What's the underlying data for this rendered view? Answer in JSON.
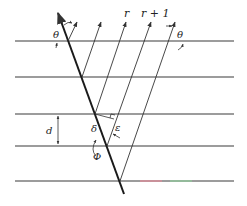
{
  "diagram": {
    "type": "geometry",
    "labels": {
      "theta_left": "θ",
      "theta_right": "θ",
      "r": "r",
      "r_plus_1": "r + 1",
      "d": "d",
      "delta": "δ",
      "epsilon": "ε",
      "phi": "Φ"
    },
    "planes": {
      "count": 5,
      "y_positions": [
        41,
        77,
        114,
        146,
        181
      ],
      "x_start": 15,
      "x_end": 234
    },
    "tilted_line": {
      "start": [
        58,
        13
      ],
      "end": [
        124,
        194
      ]
    },
    "rays": [
      {
        "from": [
          68,
          41
        ],
        "to": [
          77,
          22
        ]
      },
      {
        "from": [
          82,
          77
        ],
        "to": [
          101,
          22
        ]
      },
      {
        "from": [
          95,
          114
        ],
        "to": [
          126,
          22
        ]
      },
      {
        "from": [
          107,
          146
        ],
        "to": [
          151,
          22
        ]
      },
      {
        "from": [
          120,
          181
        ],
        "to": [
          175,
          22
        ]
      }
    ],
    "colors": {
      "lines": "#3a3a3a",
      "beam": "#1a1a1a",
      "artifact_red": "#e88a9a",
      "artifact_green": "#8fcf9c"
    }
  }
}
